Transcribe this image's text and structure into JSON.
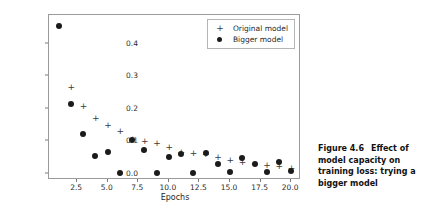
{
  "figure": {
    "caption_number": "Figure 4.6",
    "caption_text": "Effect of model capacity on training loss: trying a bigger model"
  },
  "legend": {
    "position": "top-right",
    "entries": [
      {
        "label": "Original model",
        "marker": "plus-marker",
        "color": "#3a3a3a"
      },
      {
        "label": "Bigger model",
        "marker": "dot-marker",
        "color": "#1b1b1b"
      }
    ]
  },
  "axes": {
    "xlabel": "Epochs",
    "ylabel": "",
    "xticks": [
      "2.5",
      "5.0",
      "7.5",
      "10.0",
      "12.5",
      "15.0",
      "17.5",
      "20.0"
    ],
    "yticks": [
      "0.0",
      "0.1",
      "0.2",
      "0.3",
      "0.4"
    ]
  },
  "chart_data": {
    "type": "scatter",
    "title": "",
    "xlabel": "Epochs",
    "ylabel": "",
    "xlim": [
      0.2,
      20.8
    ],
    "ylim": [
      -0.02,
      0.49
    ],
    "grid": false,
    "legend_position": "upper right",
    "xticks": [
      2.5,
      5.0,
      7.5,
      10.0,
      12.5,
      15.0,
      17.5,
      20.0
    ],
    "yticks": [
      0.0,
      0.1,
      0.2,
      0.3,
      0.4
    ],
    "x": [
      1,
      2,
      3,
      4,
      5,
      6,
      7,
      8,
      9,
      10,
      11,
      12,
      13,
      14,
      15,
      16,
      17,
      18,
      19,
      20
    ],
    "series": [
      {
        "name": "Original model",
        "marker": "+",
        "color": "#3a3a3a",
        "values": [
          null,
          0.268,
          0.208,
          0.172,
          0.151,
          0.13,
          0.107,
          0.101,
          0.093,
          0.081,
          0.066,
          0.063,
          0.06,
          0.05,
          0.043,
          0.037,
          0.031,
          0.026,
          0.022,
          0.017
        ]
      },
      {
        "name": "Bigger model",
        "marker": "o",
        "color": "#1b1b1b",
        "values": [
          0.455,
          0.215,
          0.122,
          0.055,
          0.067,
          0.003,
          0.104,
          0.074,
          0.003,
          0.052,
          0.061,
          0.003,
          0.064,
          0.03,
          0.004,
          0.047,
          0.03,
          0.005,
          0.035,
          0.008
        ]
      }
    ]
  }
}
